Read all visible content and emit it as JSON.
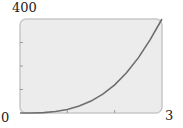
{
  "chart_data": {
    "type": "line",
    "title": "",
    "xlabel": "",
    "ylabel": "",
    "xlim": [
      0,
      3
    ],
    "ylim": [
      0,
      400
    ],
    "x_tick_labels": {
      "min": "0",
      "max": "3"
    },
    "y_tick_labels": {
      "max": "400"
    },
    "x_ticks": [
      1,
      2
    ],
    "y_ticks": [
      100,
      200,
      300
    ],
    "grid": false,
    "series": [
      {
        "name": "curve",
        "x": [
          0,
          0.25,
          0.5,
          0.75,
          1,
          1.25,
          1.5,
          1.75,
          2,
          2.25,
          2.5,
          2.75,
          3
        ],
        "values": [
          0,
          0.2,
          1.9,
          6.3,
          15,
          29.3,
          50.6,
          80.4,
          120,
          170.9,
          234.4,
          311.9,
          405
        ]
      }
    ],
    "colors": {
      "plot_bg": "#ececec",
      "frame": "#c8c8c8",
      "curve": "#6e6e6e"
    }
  }
}
